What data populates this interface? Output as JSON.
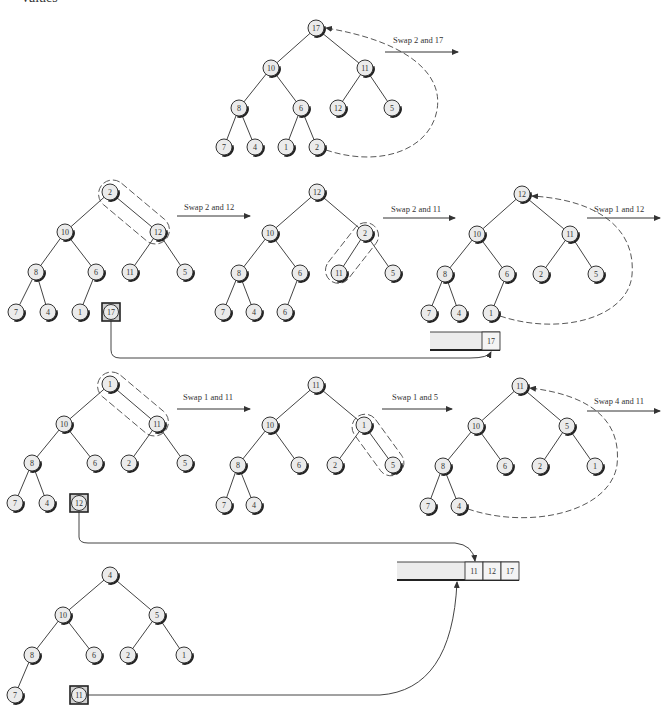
{
  "page": {
    "cut_off_heading": "values"
  },
  "colors": {
    "node_fill": "#ebebeb",
    "node_stroke": "#333333",
    "line": "#444444",
    "array_fill": "#ececec"
  },
  "trees": [
    {
      "id": "t1",
      "nodes": [
        {
          "v": "17",
          "x": 316,
          "y": 28
        },
        {
          "v": "10",
          "x": 271,
          "y": 68
        },
        {
          "v": "11",
          "x": 365,
          "y": 68
        },
        {
          "v": "8",
          "x": 239,
          "y": 108
        },
        {
          "v": "6",
          "x": 301,
          "y": 108
        },
        {
          "v": "12",
          "x": 338,
          "y": 108
        },
        {
          "v": "5",
          "x": 392,
          "y": 108
        },
        {
          "v": "7",
          "x": 224,
          "y": 147
        },
        {
          "v": "4",
          "x": 255,
          "y": 147
        },
        {
          "v": "1",
          "x": 286,
          "y": 147
        },
        {
          "v": "2",
          "x": 317,
          "y": 147
        }
      ],
      "edges": [
        [
          0,
          1
        ],
        [
          0,
          2
        ],
        [
          1,
          3
        ],
        [
          1,
          4
        ],
        [
          2,
          5
        ],
        [
          2,
          6
        ],
        [
          3,
          7
        ],
        [
          3,
          8
        ],
        [
          4,
          9
        ],
        [
          4,
          10
        ]
      ]
    },
    {
      "id": "t2",
      "nodes": [
        {
          "v": "2",
          "x": 110,
          "y": 192
        },
        {
          "v": "10",
          "x": 65,
          "y": 232
        },
        {
          "v": "12",
          "x": 158,
          "y": 232
        },
        {
          "v": "8",
          "x": 36,
          "y": 272
        },
        {
          "v": "6",
          "x": 96,
          "y": 272
        },
        {
          "v": "11",
          "x": 130,
          "y": 272
        },
        {
          "v": "5",
          "x": 185,
          "y": 272
        },
        {
          "v": "7",
          "x": 16,
          "y": 312
        },
        {
          "v": "4",
          "x": 48,
          "y": 312
        },
        {
          "v": "1",
          "x": 80,
          "y": 312
        }
      ],
      "edges": [
        [
          0,
          1
        ],
        [
          0,
          2
        ],
        [
          1,
          3
        ],
        [
          1,
          4
        ],
        [
          2,
          5
        ],
        [
          2,
          6
        ],
        [
          3,
          7
        ],
        [
          3,
          8
        ],
        [
          4,
          9
        ]
      ],
      "removed": {
        "v": "17",
        "x": 111,
        "y": 312
      }
    },
    {
      "id": "t3",
      "nodes": [
        {
          "v": "12",
          "x": 317,
          "y": 192
        },
        {
          "v": "10",
          "x": 270,
          "y": 233
        },
        {
          "v": "2",
          "x": 365,
          "y": 233
        },
        {
          "v": "8",
          "x": 239,
          "y": 273
        },
        {
          "v": "6",
          "x": 300,
          "y": 273
        },
        {
          "v": "11",
          "x": 339,
          "y": 273
        },
        {
          "v": "5",
          "x": 393,
          "y": 273
        },
        {
          "v": "7",
          "x": 223,
          "y": 312
        },
        {
          "v": "4",
          "x": 254,
          "y": 312
        },
        {
          "v": "6",
          "x": 285,
          "y": 312
        }
      ],
      "edges": [
        [
          0,
          1
        ],
        [
          0,
          2
        ],
        [
          1,
          3
        ],
        [
          1,
          4
        ],
        [
          2,
          5
        ],
        [
          2,
          6
        ],
        [
          3,
          7
        ],
        [
          3,
          8
        ],
        [
          4,
          9
        ]
      ]
    },
    {
      "id": "t4",
      "nodes": [
        {
          "v": "12",
          "x": 522,
          "y": 194
        },
        {
          "v": "10",
          "x": 477,
          "y": 234
        },
        {
          "v": "11",
          "x": 570,
          "y": 234
        },
        {
          "v": "8",
          "x": 445,
          "y": 274
        },
        {
          "v": "6",
          "x": 507,
          "y": 274
        },
        {
          "v": "2",
          "x": 541,
          "y": 274
        },
        {
          "v": "5",
          "x": 596,
          "y": 274
        },
        {
          "v": "7",
          "x": 429,
          "y": 313
        },
        {
          "v": "4",
          "x": 459,
          "y": 313
        },
        {
          "v": "1",
          "x": 491,
          "y": 313
        }
      ],
      "edges": [
        [
          0,
          1
        ],
        [
          0,
          2
        ],
        [
          1,
          3
        ],
        [
          1,
          4
        ],
        [
          2,
          5
        ],
        [
          2,
          6
        ],
        [
          3,
          7
        ],
        [
          3,
          8
        ],
        [
          4,
          9
        ]
      ]
    },
    {
      "id": "t5",
      "nodes": [
        {
          "v": "1",
          "x": 110,
          "y": 384
        },
        {
          "v": "10",
          "x": 64,
          "y": 424
        },
        {
          "v": "11",
          "x": 157,
          "y": 424
        },
        {
          "v": "8",
          "x": 32,
          "y": 463
        },
        {
          "v": "6",
          "x": 95,
          "y": 463
        },
        {
          "v": "2",
          "x": 129,
          "y": 463
        },
        {
          "v": "5",
          "x": 185,
          "y": 463
        },
        {
          "v": "7",
          "x": 15,
          "y": 503
        },
        {
          "v": "4",
          "x": 47,
          "y": 503
        }
      ],
      "edges": [
        [
          0,
          1
        ],
        [
          0,
          2
        ],
        [
          1,
          3
        ],
        [
          1,
          4
        ],
        [
          2,
          5
        ],
        [
          2,
          6
        ],
        [
          3,
          7
        ],
        [
          3,
          8
        ]
      ],
      "removed": {
        "v": "12",
        "x": 79,
        "y": 503
      }
    },
    {
      "id": "t6",
      "nodes": [
        {
          "v": "11",
          "x": 316,
          "y": 385
        },
        {
          "v": "10",
          "x": 270,
          "y": 425
        },
        {
          "v": "1",
          "x": 364,
          "y": 425
        },
        {
          "v": "8",
          "x": 238,
          "y": 465
        },
        {
          "v": "6",
          "x": 299,
          "y": 465
        },
        {
          "v": "2",
          "x": 335,
          "y": 465
        },
        {
          "v": "5",
          "x": 393,
          "y": 465
        },
        {
          "v": "7",
          "x": 224,
          "y": 505
        },
        {
          "v": "4",
          "x": 254,
          "y": 505
        }
      ],
      "edges": [
        [
          0,
          1
        ],
        [
          0,
          2
        ],
        [
          1,
          3
        ],
        [
          1,
          4
        ],
        [
          2,
          5
        ],
        [
          2,
          6
        ],
        [
          3,
          7
        ],
        [
          3,
          8
        ]
      ]
    },
    {
      "id": "t7",
      "nodes": [
        {
          "v": "11",
          "x": 520,
          "y": 386
        },
        {
          "v": "10",
          "x": 476,
          "y": 426
        },
        {
          "v": "5",
          "x": 567,
          "y": 426
        },
        {
          "v": "8",
          "x": 443,
          "y": 466
        },
        {
          "v": "6",
          "x": 505,
          "y": 466
        },
        {
          "v": "2",
          "x": 540,
          "y": 466
        },
        {
          "v": "1",
          "x": 595,
          "y": 466
        },
        {
          "v": "7",
          "x": 428,
          "y": 506
        },
        {
          "v": "4",
          "x": 459,
          "y": 506
        }
      ],
      "edges": [
        [
          0,
          1
        ],
        [
          0,
          2
        ],
        [
          1,
          3
        ],
        [
          1,
          4
        ],
        [
          2,
          5
        ],
        [
          2,
          6
        ],
        [
          3,
          7
        ],
        [
          3,
          8
        ]
      ]
    },
    {
      "id": "t8",
      "nodes": [
        {
          "v": "4",
          "x": 110,
          "y": 575
        },
        {
          "v": "10",
          "x": 63,
          "y": 615
        },
        {
          "v": "5",
          "x": 157,
          "y": 615
        },
        {
          "v": "8",
          "x": 32,
          "y": 655
        },
        {
          "v": "6",
          "x": 94,
          "y": 655
        },
        {
          "v": "2",
          "x": 128,
          "y": 655
        },
        {
          "v": "1",
          "x": 184,
          "y": 655
        },
        {
          "v": "7",
          "x": 15,
          "y": 695
        }
      ],
      "edges": [
        [
          0,
          1
        ],
        [
          0,
          2
        ],
        [
          1,
          3
        ],
        [
          1,
          4
        ],
        [
          2,
          5
        ],
        [
          2,
          6
        ],
        [
          3,
          7
        ]
      ],
      "removed": {
        "v": "11",
        "x": 79,
        "y": 695
      }
    }
  ],
  "swaps": [
    {
      "label": "Swap 2 and 17",
      "tx": 393,
      "ty": 43,
      "x1": 385,
      "x2": 458,
      "y": 52
    },
    {
      "label": "Swap 2 and 12",
      "tx": 184,
      "ty": 210,
      "x1": 177,
      "x2": 250,
      "y": 216
    },
    {
      "label": "Swap 2 and 11",
      "tx": 391,
      "ty": 212,
      "x1": 383,
      "x2": 455,
      "y": 218
    },
    {
      "label": "Swap 1 and 12",
      "tx": 594,
      "ty": 212,
      "x1": 587,
      "x2": 660,
      "y": 218
    },
    {
      "label": "Swap 1 and 11",
      "tx": 183,
      "ty": 400,
      "x1": 177,
      "x2": 250,
      "y": 409
    },
    {
      "label": "Swap 1 and 5",
      "tx": 392,
      "ty": 400,
      "x1": 382,
      "x2": 452,
      "y": 409
    },
    {
      "label": "Swap 4 and 11",
      "tx": 594,
      "ty": 404,
      "x1": 587,
      "x2": 660,
      "y": 411
    }
  ],
  "arrays": [
    {
      "id": "arr1",
      "x": 430,
      "y": 332,
      "w": 70,
      "h": 18,
      "cells": [
        "17"
      ],
      "cell_w": 18
    },
    {
      "id": "arr2",
      "x": 397,
      "y": 562,
      "w": 122,
      "h": 18,
      "cells": [
        "11",
        "12",
        "17"
      ],
      "cell_w": 18
    }
  ]
}
